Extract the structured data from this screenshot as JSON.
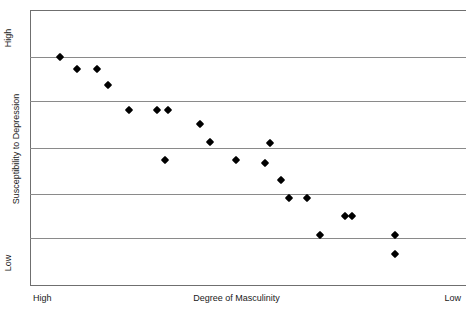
{
  "chart_data": {
    "type": "scatter",
    "title": "",
    "title_clipped": "",
    "xlabel": "Degree of Masculinity",
    "ylabel": "Susceptibility to Depression",
    "x_tick_labels": [
      "High",
      "Low"
    ],
    "y_tick_labels": [
      "High",
      "Low"
    ],
    "x_axis_direction": "High (left) to Low (right)",
    "y_axis_direction": "High (top) to Low (bottom)",
    "xlim": [
      0,
      100
    ],
    "ylim": [
      0,
      100
    ],
    "grid": "horizontal",
    "gridline_count": 7,
    "gridline_positions": [
      100,
      83,
      67,
      50,
      33,
      17,
      0
    ],
    "legend": "none",
    "marker": "diamond",
    "marker_color": "#000000",
    "relationship": "negative",
    "n_points": 20,
    "points": [
      {
        "x": 6.9,
        "y": 82.9
      },
      {
        "x": 10.8,
        "y": 78.5
      },
      {
        "x": 15.4,
        "y": 78.5
      },
      {
        "x": 17.9,
        "y": 72.7
      },
      {
        "x": 22.7,
        "y": 63.6
      },
      {
        "x": 29.1,
        "y": 63.6
      },
      {
        "x": 31.7,
        "y": 63.6
      },
      {
        "x": 39.0,
        "y": 58.5
      },
      {
        "x": 31.0,
        "y": 45.5
      },
      {
        "x": 41.3,
        "y": 52.0
      },
      {
        "x": 47.2,
        "y": 45.5
      },
      {
        "x": 53.9,
        "y": 44.4
      },
      {
        "x": 55.0,
        "y": 51.6
      },
      {
        "x": 57.6,
        "y": 38.2
      },
      {
        "x": 59.4,
        "y": 31.6
      },
      {
        "x": 63.5,
        "y": 31.6
      },
      {
        "x": 72.2,
        "y": 25.1
      },
      {
        "x": 73.9,
        "y": 25.1
      },
      {
        "x": 66.5,
        "y": 18.2
      },
      {
        "x": 83.7,
        "y": 18.2
      },
      {
        "x": 83.7,
        "y": 11.3
      }
    ]
  },
  "axes": {
    "y_title": "Susceptibility to Depression",
    "y_top_label": "High",
    "y_bottom_label": "Low",
    "x_title": "Degree of Masculinity",
    "x_left_label": "High",
    "x_right_label": "Low"
  },
  "colors": {
    "marker": "#000000",
    "gridline": "#8a8a8a",
    "frame": "#6f6f6f",
    "background": "#ffffff",
    "text": "#1a1a1a"
  }
}
